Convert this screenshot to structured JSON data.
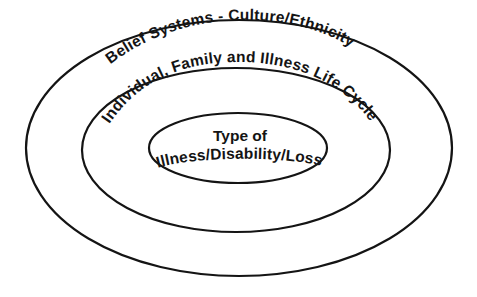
{
  "diagram": {
    "type": "concentric-ellipses",
    "background_color": "#ffffff",
    "stroke_color": "#141414",
    "text_color": "#141414",
    "fill_color": "#ffffff",
    "rings": [
      {
        "id": "outer-ring",
        "level": 1,
        "label": "Belief Systems - Culture/Ethnicity",
        "stroke_width": 2.2,
        "center_x": 239,
        "center_y": 148,
        "rx": 213,
        "ry": 128
      },
      {
        "id": "middle-ring",
        "level": 2,
        "label": "Individual, Family and Illness Life Cycle",
        "stroke_width": 2.2,
        "center_x": 236,
        "center_y": 150,
        "rx": 154,
        "ry": 82
      },
      {
        "id": "inner-ring",
        "level": 3,
        "label_line_1": "Type of",
        "label_line_2": "Illness/Disability/Loss",
        "stroke_width": 2.2,
        "center_x": 238,
        "center_y": 148,
        "rx": 89,
        "ry": 35
      }
    ]
  }
}
